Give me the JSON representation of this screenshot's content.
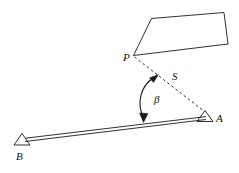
{
  "figure": {
    "background_color": "#ffffff",
    "line_color": "#1a1a1a",
    "labels": {
      "point_p": "P",
      "point_s": "S",
      "point_a": "A",
      "point_b": "B",
      "angle_beta": "β"
    },
    "elements": {
      "building_rect": "tilted-rectangle",
      "baseline": "double-line-baseline-B-to-A",
      "station_a": "triangle-station-marker",
      "station_b": "triangle-station-marker",
      "sight_line": "dashed-line-P-to-A",
      "angle_arc": "double-headed-arc"
    },
    "geometry": {
      "rect_corners": "151,18 224,12 228,44 133,55",
      "p": "133,55",
      "s": "176,76",
      "a_apex": "205,112",
      "b_apex": "22,135",
      "arc_label_pos": "158,99"
    }
  }
}
